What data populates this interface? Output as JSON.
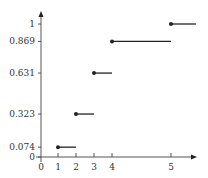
{
  "chart_data": {
    "type": "step",
    "title": "",
    "xlabel": "",
    "ylabel": "",
    "x_ticks": [
      "0",
      "1",
      "2",
      "3",
      "4",
      "5"
    ],
    "y_ticks": [
      "0",
      "0.074",
      "0.323",
      "0.631",
      "0.869",
      "1"
    ],
    "segments": [
      {
        "x_start": 1,
        "x_end": 2,
        "y": 0.074
      },
      {
        "x_start": 2,
        "x_end": 3,
        "y": 0.323
      },
      {
        "x_start": 3,
        "x_end": 4,
        "y": 0.631
      },
      {
        "x_start": 4,
        "x_end": 5,
        "y": 0.869
      },
      {
        "x_start": 5,
        "x_end": null,
        "y": 1
      }
    ],
    "ylim": [
      0,
      1
    ],
    "grid": false,
    "colors": {
      "line": "#222222",
      "axis": "#555555"
    }
  }
}
